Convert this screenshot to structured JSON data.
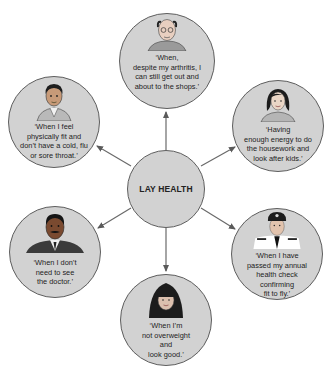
{
  "diagram": {
    "title": "LAY HEALTH",
    "center": {
      "label": "LAY HEALTH",
      "cx": 166,
      "cy": 189,
      "r": 39
    },
    "nodes": [
      {
        "id": "top",
        "person": "elderly man with glasses",
        "cx": 167,
        "cy": 61,
        "r": 48,
        "quote": "‘When,\ndespite my arthritis, I\ncan still get out and\nabout to the shops.’"
      },
      {
        "id": "top-left",
        "person": "young man",
        "cx": 54,
        "cy": 122,
        "r": 46,
        "quote": "‘When I feel\nphysically fit and\ndon’t have a cold, flu\nor sore throat.’"
      },
      {
        "id": "top-right",
        "person": "woman with dark hair",
        "cx": 278,
        "cy": 126,
        "r": 46,
        "quote": "‘Having\nenough energy to do\nthe housework and\nlook after kids.’"
      },
      {
        "id": "bottom-left",
        "person": "man with moustache in suit",
        "cx": 55,
        "cy": 252,
        "r": 46,
        "quote": "‘When I don’t\nneed to see\nthe doctor.’"
      },
      {
        "id": "bottom-right",
        "person": "airline pilot in uniform",
        "cx": 277,
        "cy": 254,
        "r": 46,
        "quote": "‘When I have\npassed my annual\nhealth check\nconfirming\nfit to fly.’"
      },
      {
        "id": "bottom",
        "person": "young woman with fringe",
        "cx": 166,
        "cy": 320,
        "r": 46,
        "quote": "‘When I’m\nnot overweight\nand\nlook good.’"
      }
    ],
    "colors": {
      "node_fill": "#d2d2d2",
      "node_border": "#5e5e5e",
      "arrow": "#6a6a6a",
      "background": "#ffffff"
    }
  }
}
